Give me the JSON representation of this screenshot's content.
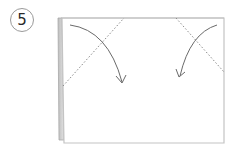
{
  "step": {
    "number": "5"
  },
  "diagram": {
    "elements": {
      "paper": "rectangle-sheet",
      "left_edge_layer": "folded-back-flap",
      "fold_lines": [
        "left-diagonal-valley-fold",
        "right-diagonal-valley-fold"
      ],
      "arrows": [
        "left-corner-fold-arrow",
        "right-corner-fold-arrow"
      ]
    },
    "colors": {
      "paper_edge": "#c8c8c8",
      "flap_shade": "#d4d4d4",
      "flap_edge": "#9a9a9a",
      "fold_line": "#8a8a8a",
      "arrow": "#6a6a6a",
      "badge_border": "#9a9a9a",
      "badge_text": "#2a2a2a"
    }
  }
}
